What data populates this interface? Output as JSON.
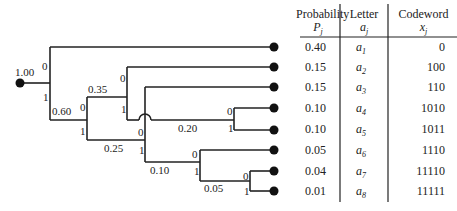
{
  "diagram": {
    "root": {
      "label": "1.00"
    },
    "internal_nodes": [
      {
        "id": "n060",
        "label": "0.60"
      },
      {
        "id": "n035",
        "label": "0.35"
      },
      {
        "id": "n025",
        "label": "0.25"
      },
      {
        "id": "n020",
        "label": "0.20"
      },
      {
        "id": "n010",
        "label": "0.10"
      },
      {
        "id": "n005",
        "label": "0.05"
      }
    ],
    "branch_bits": {
      "zero": "0",
      "one": "1"
    }
  },
  "table": {
    "headers": [
      {
        "line1": "Probability",
        "line2": "P",
        "line2_sub": "j"
      },
      {
        "line1": "Letter",
        "line2": "a",
        "line2_sub": "j"
      },
      {
        "line1": "Codeword",
        "line2": "x",
        "line2_sub": "j"
      }
    ],
    "rows": [
      {
        "prob": "0.40",
        "letter": "a",
        "sub": "1",
        "code": "0"
      },
      {
        "prob": "0.15",
        "letter": "a",
        "sub": "2",
        "code": "100"
      },
      {
        "prob": "0.15",
        "letter": "a",
        "sub": "3",
        "code": "110"
      },
      {
        "prob": "0.10",
        "letter": "a",
        "sub": "4",
        "code": "1010"
      },
      {
        "prob": "0.10",
        "letter": "a",
        "sub": "5",
        "code": "1011"
      },
      {
        "prob": "0.05",
        "letter": "a",
        "sub": "6",
        "code": "1110"
      },
      {
        "prob": "0.04",
        "letter": "a",
        "sub": "7",
        "code": "11110"
      },
      {
        "prob": "0.01",
        "letter": "a",
        "sub": "8",
        "code": "11111"
      }
    ]
  }
}
